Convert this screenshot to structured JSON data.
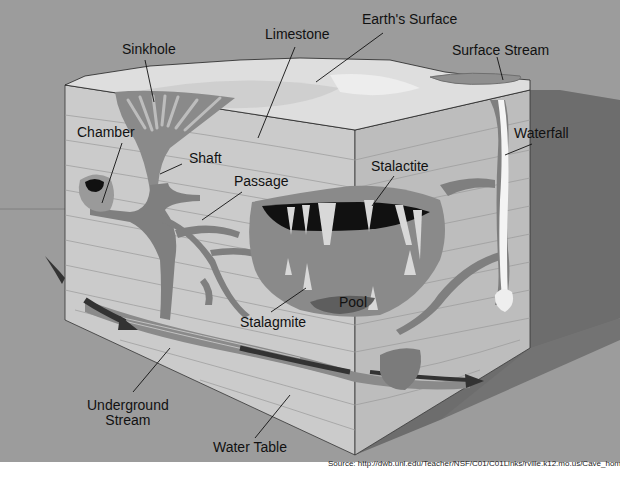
{
  "diagram": {
    "colors": {
      "background": "#9c9c9c",
      "shadow": "#6d6d6d",
      "rock_face": "#c9c9c9",
      "surface": "#dcdcdc",
      "cave": "#7d7d7d",
      "void": "#111111",
      "water": "#5a5a5a",
      "bottom_band": "#ffffff"
    },
    "labels": {
      "earths_surface": "Earth's Surface",
      "limestone": "Limestone",
      "sinkhole": "Sinkhole",
      "surface_stream": "Surface Stream",
      "chamber": "Chamber",
      "shaft": "Shaft",
      "passage": "Passage",
      "stalactite": "Stalactite",
      "waterfall": "Waterfall",
      "pool": "Pool",
      "stalagmite": "Stalagmite",
      "underground_stream_line1": "Underground",
      "underground_stream_line2": "Stream",
      "water_table": "Water Table"
    },
    "source": "Source: http://dwb.unl.edu/Teacher/NSF/C01/C01Links/rville.k12.mo.us/Cave_home.htm"
  }
}
